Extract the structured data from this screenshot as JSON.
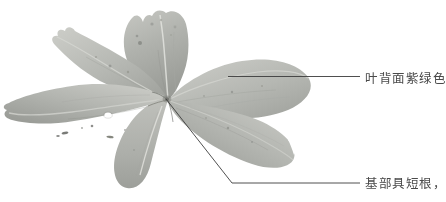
{
  "figure": {
    "kind": "botanical-specimen-photograph",
    "background_color": "#ffffff",
    "width": 446,
    "height": 202,
    "color_mode": "grayscale"
  },
  "specimen": {
    "description": "pressed herbarium specimen: whorl of broad leaves radiating from a central node",
    "leaf_count": 6,
    "whorl_center": {
      "x": 168,
      "y": 100
    },
    "tones": {
      "leaf_base": "#b2b3ae",
      "leaf_light": "#c8c9c4",
      "leaf_shadow": "#8f918c",
      "vein_light": "#d9dad5",
      "vein_dark": "#7d7f7a",
      "blemish": "#5a5c57",
      "hole": "#ffffff"
    },
    "leaves": [
      {
        "name": "leaf-upper-center",
        "note": "erect leaf at top with torn/eroded left margin"
      },
      {
        "name": "leaf-upper-left",
        "note": "broad leaf angling up-left, jagged apex"
      },
      {
        "name": "leaf-left",
        "note": "largest leaf, extends to left edge, bears a small round hole and dark blemishes"
      },
      {
        "name": "leaf-lower-center",
        "note": "narrow oblong leaf hanging straight down"
      },
      {
        "name": "leaf-upper-right",
        "note": "broad ovate leaf to the upper right"
      },
      {
        "name": "leaf-lower-right",
        "note": "broad leaf to the lower right with notched margin"
      }
    ]
  },
  "annotations": [
    {
      "id": "upper",
      "text": "叶背面紫绿色",
      "meaning_hint": "leaf-abaxial-surface-purple-green",
      "leader": {
        "type": "horizontal",
        "points": [
          [
            228,
            76
          ],
          [
            360,
            76
          ]
        ],
        "color": "#3c3c3c",
        "width": 0.9
      },
      "text_position": {
        "x": 365,
        "y": 68
      }
    },
    {
      "id": "lower",
      "text": "基部具短根，",
      "meaning_hint": "base-bears-short-roots",
      "truncated_at_right_edge": true,
      "leader": {
        "type": "elbow",
        "points": [
          [
            166,
            99
          ],
          [
            232,
            183
          ],
          [
            360,
            183
          ]
        ],
        "color": "#3c3c3c",
        "width": 0.9
      },
      "text_position": {
        "x": 365,
        "y": 173
      }
    }
  ],
  "text_style": {
    "color": "#4a4a4a",
    "font_size_px": 12.5
  }
}
